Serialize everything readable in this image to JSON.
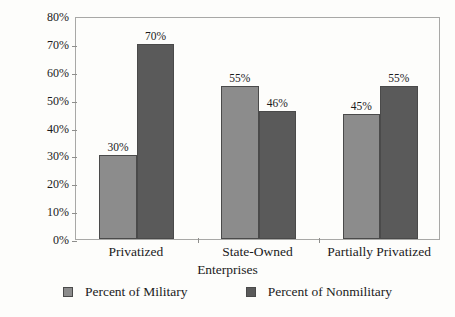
{
  "chart_data": {
    "type": "bar",
    "title": "",
    "xlabel": "Enterprises",
    "ylabel": "Top Personnel in SOEs",
    "categories": [
      "Privatized",
      "State-Owned",
      "Partially Privatized"
    ],
    "series": [
      {
        "name": "Percent of Military",
        "color": "#8c8c8c",
        "values": [
          30,
          55,
          45
        ],
        "labels": [
          "30%",
          "55%",
          "45%"
        ]
      },
      {
        "name": "Percent of Nonmilitary",
        "color": "#5a5a5a",
        "values": [
          70,
          46,
          55
        ],
        "labels": [
          "70%",
          "46%",
          "55%"
        ]
      }
    ],
    "ylim": [
      0,
      80
    ],
    "ytick_values": [
      0,
      10,
      20,
      30,
      40,
      50,
      60,
      70,
      80
    ],
    "ytick_labels": [
      "0%",
      "10%",
      "20%",
      "30%",
      "40%",
      "50%",
      "60%",
      "70%",
      "80%"
    ],
    "grid": false,
    "legend_position": "bottom",
    "value_labels_shown": true
  }
}
